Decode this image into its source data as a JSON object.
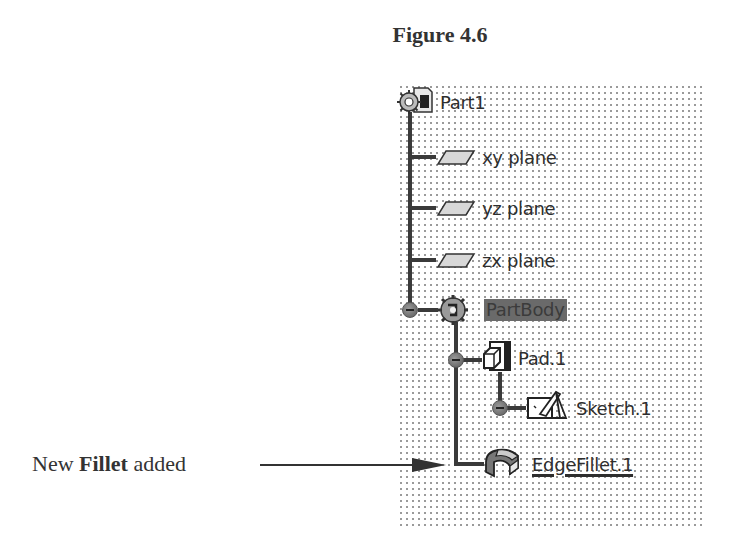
{
  "figure": {
    "title": "Figure 4.6"
  },
  "tree": {
    "root": {
      "label": "Part1",
      "icon": "part-document-icon"
    },
    "planes": [
      {
        "label": "xy plane",
        "icon": "plane-icon"
      },
      {
        "label": "yz plane",
        "icon": "plane-icon"
      },
      {
        "label": "zx plane",
        "icon": "plane-icon"
      }
    ],
    "body": {
      "label": "PartBody",
      "icon": "body-gear-icon",
      "highlighted": true,
      "children": [
        {
          "label": "Pad.1",
          "icon": "pad-icon",
          "children": [
            {
              "label": "Sketch.1",
              "icon": "sketch-icon"
            }
          ]
        },
        {
          "label": "EdgeFillet.1",
          "icon": "edge-fillet-icon",
          "underlined": true
        }
      ]
    }
  },
  "annotation": {
    "prefix": "New ",
    "bold": "Fillet",
    "suffix": " added",
    "target": "EdgeFillet.1"
  },
  "colors": {
    "tree_line": "#3a3a3a",
    "highlight_bg": "#6a6a6a",
    "grid_dot": "#9a9a9a"
  }
}
